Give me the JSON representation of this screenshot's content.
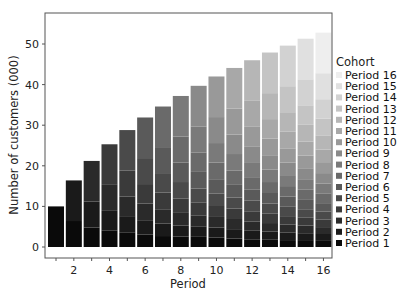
{
  "chart_data": {
    "type": "bar",
    "stacked": true,
    "title": "",
    "xlabel": "Period",
    "ylabel": "Number of customers (000)",
    "ylim": [
      0,
      57
    ],
    "yticks": [
      0,
      10,
      20,
      30,
      40,
      50
    ],
    "xticks_labeled": [
      2,
      4,
      6,
      8,
      10,
      12,
      14,
      16
    ],
    "grid": false,
    "legend_title": "Cohort",
    "legend_position": "right",
    "categories": [
      1,
      2,
      3,
      4,
      5,
      6,
      7,
      8,
      9,
      10,
      11,
      12,
      13,
      14,
      15,
      16
    ],
    "totals": [
      10.0,
      16.4,
      21.2,
      25.3,
      28.8,
      31.9,
      34.6,
      37.2,
      39.7,
      42.0,
      44.1,
      46.0,
      47.9,
      49.6,
      51.3,
      52.8
    ],
    "retained_by_age": [
      10.0,
      6.4,
      4.8,
      4.1,
      3.5,
      3.1,
      2.7,
      2.6,
      2.5,
      2.3,
      2.1,
      1.9,
      1.9,
      1.7,
      1.7,
      1.5
    ],
    "series": [
      {
        "name": "Period 1",
        "color": "#0a0a0a",
        "values": [
          10.0,
          6.4,
          4.8,
          4.1,
          3.5,
          3.1,
          2.7,
          2.6,
          2.5,
          2.3,
          2.1,
          1.9,
          1.9,
          1.7,
          1.7,
          1.5
        ]
      },
      {
        "name": "Period 2",
        "color": "#1a1a1a",
        "values": [
          0,
          10.0,
          6.4,
          4.8,
          4.1,
          3.5,
          3.1,
          2.7,
          2.6,
          2.5,
          2.3,
          2.1,
          1.9,
          1.9,
          1.7,
          1.7
        ]
      },
      {
        "name": "Period 3",
        "color": "#2a2a2a",
        "values": [
          0,
          0,
          10.0,
          6.4,
          4.8,
          4.1,
          3.5,
          3.1,
          2.7,
          2.6,
          2.5,
          2.3,
          2.1,
          1.9,
          1.9,
          1.7
        ]
      },
      {
        "name": "Period 4",
        "color": "#3a3a3a",
        "values": [
          0,
          0,
          0,
          10.0,
          6.4,
          4.8,
          4.1,
          3.5,
          3.1,
          2.7,
          2.6,
          2.5,
          2.3,
          2.1,
          1.9,
          1.9
        ]
      },
      {
        "name": "Period 5",
        "color": "#4a4a4a",
        "values": [
          0,
          0,
          0,
          0,
          10.0,
          6.4,
          4.8,
          4.1,
          3.5,
          3.1,
          2.7,
          2.6,
          2.5,
          2.3,
          2.1,
          1.9
        ]
      },
      {
        "name": "Period 6",
        "color": "#5a5a5a",
        "values": [
          0,
          0,
          0,
          0,
          0,
          10.0,
          6.4,
          4.8,
          4.1,
          3.5,
          3.1,
          2.7,
          2.6,
          2.5,
          2.3,
          2.1
        ]
      },
      {
        "name": "Period 7",
        "color": "#6a6a6a",
        "values": [
          0,
          0,
          0,
          0,
          0,
          0,
          10.0,
          6.4,
          4.8,
          4.1,
          3.5,
          3.1,
          2.7,
          2.6,
          2.5,
          2.3
        ]
      },
      {
        "name": "Period 8",
        "color": "#7a7a7a",
        "values": [
          0,
          0,
          0,
          0,
          0,
          0,
          0,
          10.0,
          6.4,
          4.8,
          4.1,
          3.5,
          3.1,
          2.7,
          2.6,
          2.5
        ]
      },
      {
        "name": "Period 9",
        "color": "#8a8a8a",
        "values": [
          0,
          0,
          0,
          0,
          0,
          0,
          0,
          0,
          10.0,
          6.4,
          4.8,
          4.1,
          3.5,
          3.1,
          2.7,
          2.6
        ]
      },
      {
        "name": "Period 10",
        "color": "#999999",
        "values": [
          0,
          0,
          0,
          0,
          0,
          0,
          0,
          0,
          0,
          10.0,
          6.4,
          4.8,
          4.1,
          3.5,
          3.1,
          2.7
        ]
      },
      {
        "name": "Period 11",
        "color": "#a8a8a8",
        "values": [
          0,
          0,
          0,
          0,
          0,
          0,
          0,
          0,
          0,
          0,
          10.0,
          6.4,
          4.8,
          4.1,
          3.5,
          3.1
        ]
      },
      {
        "name": "Period 12",
        "color": "#b6b6b6",
        "values": [
          0,
          0,
          0,
          0,
          0,
          0,
          0,
          0,
          0,
          0,
          0,
          10.0,
          6.4,
          4.8,
          4.1,
          3.5
        ]
      },
      {
        "name": "Period 13",
        "color": "#c4c4c4",
        "values": [
          0,
          0,
          0,
          0,
          0,
          0,
          0,
          0,
          0,
          0,
          0,
          0,
          10.0,
          6.4,
          4.8,
          4.1
        ]
      },
      {
        "name": "Period 14",
        "color": "#d2d2d2",
        "values": [
          0,
          0,
          0,
          0,
          0,
          0,
          0,
          0,
          0,
          0,
          0,
          0,
          0,
          10.0,
          6.4,
          4.8
        ]
      },
      {
        "name": "Period 15",
        "color": "#e0e0e0",
        "values": [
          0,
          0,
          0,
          0,
          0,
          0,
          0,
          0,
          0,
          0,
          0,
          0,
          0,
          0,
          10.0,
          6.4
        ]
      },
      {
        "name": "Period 16",
        "color": "#eeeeee",
        "values": [
          0,
          0,
          0,
          0,
          0,
          0,
          0,
          0,
          0,
          0,
          0,
          0,
          0,
          0,
          0,
          10.0
        ]
      }
    ]
  }
}
